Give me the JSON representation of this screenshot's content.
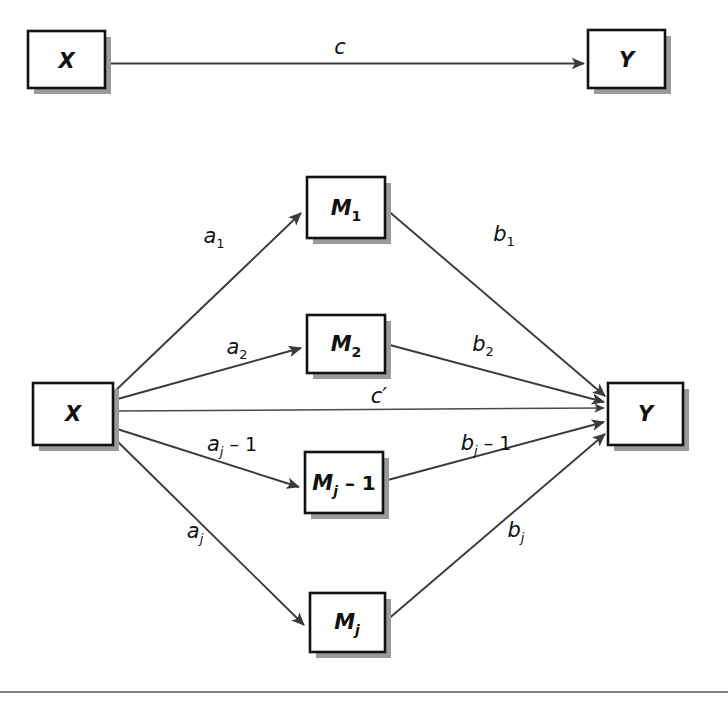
{
  "figure": {
    "type": "path-diagram",
    "panels": [
      {
        "name": "total-effect-model",
        "nodes": [
          {
            "id": "x-top",
            "label": "X",
            "x": 28,
            "y": 31,
            "w": 77,
            "h": 57
          },
          {
            "id": "y-top",
            "label": "Y",
            "x": 588,
            "y": 30,
            "w": 77,
            "h": 58
          }
        ],
        "edges": [
          {
            "id": "c",
            "from": "x-top",
            "to": "y-top",
            "label": "c",
            "sub": "",
            "op": ""
          }
        ]
      },
      {
        "name": "multiple-mediator-model",
        "nodes": [
          {
            "id": "x-bot",
            "label": "X",
            "sub": "",
            "op": "",
            "x": 33,
            "y": 383,
            "w": 80,
            "h": 62
          },
          {
            "id": "y-bot",
            "label": "Y",
            "sub": "",
            "op": "",
            "x": 608,
            "y": 383,
            "w": 75,
            "h": 62
          },
          {
            "id": "m1",
            "label": "M",
            "sub": "1",
            "op": "",
            "x": 307,
            "y": 177,
            "w": 78,
            "h": 61
          },
          {
            "id": "m2",
            "label": "M",
            "sub": "2",
            "op": "",
            "x": 307,
            "y": 315,
            "w": 78,
            "h": 58
          },
          {
            "id": "mjm1",
            "label": "M",
            "sub": "j",
            "op": " – 1",
            "x": 305,
            "y": 452,
            "w": 78,
            "h": 61
          },
          {
            "id": "mj",
            "label": "M",
            "sub": "j",
            "op": "",
            "x": 310,
            "y": 593,
            "w": 75,
            "h": 59
          }
        ],
        "edges": [
          {
            "id": "a1",
            "from": "x-bot",
            "to": "m1",
            "label": "a",
            "sub": "1",
            "op": "",
            "lx": 214,
            "ly": 236
          },
          {
            "id": "a2",
            "from": "x-bot",
            "to": "m2",
            "label": "a",
            "sub": "2",
            "op": "",
            "lx": 237,
            "ly": 347
          },
          {
            "id": "ajm1",
            "from": "x-bot",
            "to": "mjm1",
            "label": "a",
            "sub": "j",
            "op": " – 1",
            "lx": 232,
            "ly": 444
          },
          {
            "id": "aj",
            "from": "x-bot",
            "to": "mj",
            "label": "a",
            "sub": "j",
            "op": "",
            "lx": 195,
            "ly": 531
          },
          {
            "id": "b1",
            "from": "m1",
            "to": "y-bot",
            "label": "b",
            "sub": "1",
            "op": "",
            "lx": 504,
            "ly": 234
          },
          {
            "id": "b2",
            "from": "m2",
            "to": "y-bot",
            "label": "b",
            "sub": "2",
            "op": "",
            "lx": 483,
            "ly": 344
          },
          {
            "id": "bjm1",
            "from": "mjm1",
            "to": "y-bot",
            "label": "b",
            "sub": "j",
            "op": " – 1",
            "lx": 486,
            "ly": 443
          },
          {
            "id": "bj",
            "from": "mj",
            "to": "y-bot",
            "label": "b",
            "sub": "j",
            "op": "",
            "lx": 516,
            "ly": 530
          },
          {
            "id": "cprime",
            "from": "x-bot",
            "to": "y-bot",
            "label": "c′",
            "sub": "",
            "op": "",
            "lx": 379,
            "ly": 396
          }
        ]
      }
    ],
    "footer_rule": {
      "y": 692
    },
    "colors": {
      "box_border": "#111111",
      "box_fill": "#ffffff",
      "box_shadow": "#9a9a9a",
      "edge": "#3a3a3a",
      "text": "#111111",
      "rule": "#5a5a5a"
    }
  }
}
